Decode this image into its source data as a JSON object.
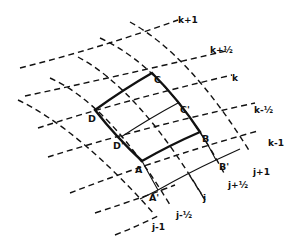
{
  "diagram": {
    "points": {
      "A": "A",
      "B": "B",
      "C": "C",
      "D": "D",
      "A_prime": "A'",
      "B_prime": "B'",
      "C_prime": "C'",
      "D_prime": "D'"
    },
    "k_lines": {
      "k_plus_1": "k+1",
      "k_plus_half": "k+½",
      "k": "k",
      "k_minus_half": "k-½",
      "k_minus_1": "k-1"
    },
    "j_lines": {
      "j_plus_1": "j+1",
      "j_plus_half": "j+½",
      "j": "j",
      "j_minus_half": "j-½",
      "j_minus_1": "j-1"
    },
    "colors": {
      "line": "#111111",
      "background": "#ffffff"
    }
  }
}
